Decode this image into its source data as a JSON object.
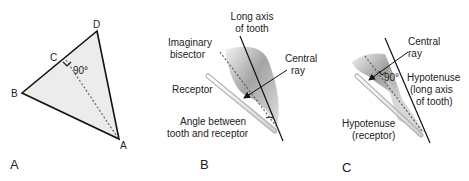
{
  "panels": {
    "a": {
      "letter": "A",
      "points": {
        "d": "D",
        "c": "C",
        "b": "B",
        "a": "A"
      },
      "angle": "90°"
    },
    "b": {
      "letter": "B",
      "long_axis": [
        "Long axis",
        "of tooth"
      ],
      "bisector": [
        "Imaginary",
        "bisector"
      ],
      "central_ray": [
        "Central",
        "ray"
      ],
      "receptor": "Receptor",
      "angle": [
        "Angle between",
        "tooth and receptor"
      ]
    },
    "c": {
      "letter": "C",
      "central_ray": [
        "Central",
        "ray"
      ],
      "angle": "90°",
      "hyp_tooth": [
        "Hypotenuse",
        "(long axis",
        "of tooth)"
      ],
      "hyp_receptor": [
        "Hypotenuse",
        "(receptor)"
      ]
    }
  },
  "colors": {
    "triangle_fill": "#ececec",
    "line": "#111111",
    "tooth_dark": "#8a8a8a",
    "receptor": "#e6e6e6"
  }
}
